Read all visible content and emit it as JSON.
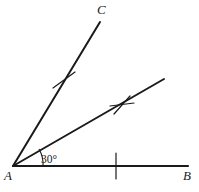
{
  "figure": {
    "kind": "geometry-angle-diagram",
    "background_color": "#ffffff",
    "stroke_color": "#1a1a1a",
    "width": 199,
    "height": 192
  },
  "labels": {
    "vertex_a": "A",
    "vertex_b": "B",
    "vertex_c": "C",
    "angle_measure": "30°"
  },
  "points": {
    "a": {
      "x": 13,
      "y": 166
    },
    "b_end": {
      "x": 188,
      "y": 166
    },
    "c_end": {
      "x": 100,
      "y": 22
    },
    "mid_ray_end": {
      "x": 164,
      "y": 79
    }
  },
  "label_positions": {
    "a": {
      "x": 5,
      "y": 170
    },
    "b": {
      "x": 184,
      "y": 170
    },
    "c": {
      "x": 98,
      "y": 4
    },
    "angle": {
      "x": 41,
      "y": 155
    }
  },
  "arc": {
    "radius": 30,
    "from_ray": "AB",
    "to_ray": "middle-ray"
  },
  "tick_marks": [
    {
      "name": "tick-on-ac",
      "style": "single",
      "x": 64,
      "y": 80
    },
    {
      "name": "tick-on-mid-ray",
      "style": "double-cross",
      "x": 122,
      "y": 105
    },
    {
      "name": "tick-on-ab",
      "style": "single",
      "x": 116,
      "y": 166
    }
  ]
}
